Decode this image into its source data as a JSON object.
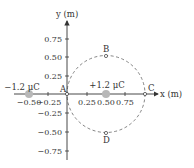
{
  "diagram": {
    "axes": {
      "x_label": "x (m)",
      "y_label": "y (m)",
      "x_ticks": [
        "−0.50",
        "−0.25",
        "0.25",
        "0.50",
        "0.75"
      ],
      "y_ticks": [
        "0.75",
        "0.50",
        "0.25",
        "−0.25",
        "−0.50",
        "−0.75"
      ]
    },
    "charges": [
      {
        "label": "−1.2 μC",
        "x": -0.5,
        "y": 0,
        "sign": "negative"
      },
      {
        "label": "+1.2 μC",
        "x": 0.5,
        "y": 0,
        "sign": "positive"
      }
    ],
    "points": [
      {
        "label": "A",
        "x": 0,
        "y": 0
      },
      {
        "label": "B",
        "x": 0.5,
        "y": 0.5
      },
      {
        "label": "C",
        "x": 1.0,
        "y": 0
      },
      {
        "label": "D",
        "x": 0.5,
        "y": -0.5
      }
    ],
    "circle": {
      "center_x": 0.5,
      "center_y": 0,
      "radius": 0.5,
      "style": "dashed"
    },
    "colors": {
      "axis": "#333333",
      "charge_fill": "#b8b8b8",
      "circle": "#666666"
    }
  }
}
